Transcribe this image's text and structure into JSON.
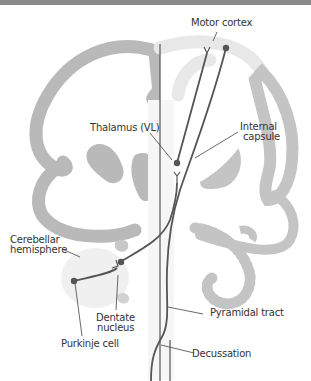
{
  "figure": {
    "type": "neuroanatomy-pathway-diagram"
  },
  "labels": {
    "motor_cortex": "Motor cortex",
    "thalamus": "Thalamus (VL)",
    "internal_capsule_line1": "Internal",
    "internal_capsule_line2": "capsule",
    "cerebellar_hemisphere_line1": "Cerebellar",
    "cerebellar_hemisphere_line2": "hemisphere",
    "dentate_nucleus_line1": "Dentate",
    "dentate_nucleus_line2": "nucleus",
    "purkinje_cell": "Purkinje cell",
    "pyramidal_tract": "Pyramidal tract",
    "decussation": "Decussation"
  },
  "colors": {
    "top_bar": "#8a8a8a",
    "left_tissue": "#b9b9b9",
    "right_tissue": "#e8e8e8",
    "right_tissue_dark": "#c4c4c4",
    "pathway": "#555555",
    "leader_line": "#444444",
    "label_text": "#333333"
  }
}
